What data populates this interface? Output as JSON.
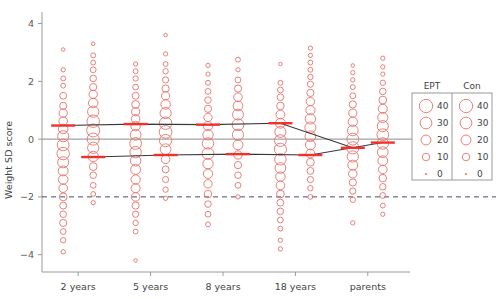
{
  "chart_data": {
    "type": "scatter",
    "title": "",
    "xlabel": "",
    "ylabel": "Weight SD score",
    "ylim": [
      -4.6,
      4.4
    ],
    "yticks": [
      4,
      2,
      0,
      -2,
      -4
    ],
    "ytick_labels": [
      "4",
      "2",
      "0",
      "−2",
      "−4"
    ],
    "categories": [
      "2 years",
      "5 years",
      "8 years",
      "18 years",
      "parents"
    ],
    "grid": false,
    "legend_position": "right",
    "reference_lines": [
      {
        "name": "zero-line",
        "y": 0,
        "style": "solid",
        "color": "#8c8c8c"
      },
      {
        "name": "minus-two-line",
        "y": -2,
        "style": "dashed",
        "color": "#4a4a6a"
      }
    ],
    "groups": [
      {
        "name": "EPT",
        "label": "EPT",
        "color": "#e8736a",
        "means": [
          0.47,
          0.52,
          0.5,
          0.55,
          -0.3
        ]
      },
      {
        "name": "Con",
        "label": "Con",
        "color": "#e8736a",
        "means": [
          -0.62,
          -0.55,
          -0.52,
          -0.55,
          -0.12
        ]
      }
    ],
    "series": [
      {
        "name": "EPT",
        "category": "2 years",
        "points": [
          {
            "y": 3.1,
            "n": 1
          },
          {
            "y": 2.4,
            "n": 2
          },
          {
            "y": 2.1,
            "n": 3
          },
          {
            "y": 1.85,
            "n": 3
          },
          {
            "y": 1.5,
            "n": 8
          },
          {
            "y": 1.15,
            "n": 9
          },
          {
            "y": 0.9,
            "n": 13
          },
          {
            "y": 0.62,
            "n": 14
          },
          {
            "y": 0.35,
            "n": 18
          },
          {
            "y": 0.1,
            "n": 26
          },
          {
            "y": -0.2,
            "n": 30
          },
          {
            "y": -0.5,
            "n": 34
          },
          {
            "y": -0.8,
            "n": 26
          },
          {
            "y": -1.1,
            "n": 20
          },
          {
            "y": -1.4,
            "n": 18
          },
          {
            "y": -1.7,
            "n": 14
          },
          {
            "y": -2.0,
            "n": 11
          },
          {
            "y": -2.3,
            "n": 8
          },
          {
            "y": -2.6,
            "n": 7
          },
          {
            "y": -2.9,
            "n": 9
          },
          {
            "y": -3.2,
            "n": 5
          },
          {
            "y": -3.5,
            "n": 4
          },
          {
            "y": -3.9,
            "n": 2
          }
        ]
      },
      {
        "name": "Con",
        "category": "2 years",
        "points": [
          {
            "y": 3.3,
            "n": 1
          },
          {
            "y": 2.9,
            "n": 3
          },
          {
            "y": 2.65,
            "n": 3
          },
          {
            "y": 2.4,
            "n": 5
          },
          {
            "y": 2.1,
            "n": 7
          },
          {
            "y": 1.8,
            "n": 9
          },
          {
            "y": 1.55,
            "n": 13
          },
          {
            "y": 1.25,
            "n": 18
          },
          {
            "y": 0.95,
            "n": 27
          },
          {
            "y": 0.62,
            "n": 34
          },
          {
            "y": 0.3,
            "n": 38
          },
          {
            "y": 0.0,
            "n": 32
          },
          {
            "y": -0.3,
            "n": 27
          },
          {
            "y": -0.6,
            "n": 22
          },
          {
            "y": -0.95,
            "n": 11
          },
          {
            "y": -1.25,
            "n": 7
          },
          {
            "y": -1.6,
            "n": 5
          },
          {
            "y": -1.9,
            "n": 3
          },
          {
            "y": -2.2,
            "n": 2
          }
        ]
      },
      {
        "name": "EPT",
        "category": "5 years",
        "points": [
          {
            "y": 2.6,
            "n": 2
          },
          {
            "y": 2.35,
            "n": 3
          },
          {
            "y": 2.1,
            "n": 4
          },
          {
            "y": 1.8,
            "n": 5
          },
          {
            "y": 1.5,
            "n": 8
          },
          {
            "y": 1.2,
            "n": 11
          },
          {
            "y": 0.95,
            "n": 12
          },
          {
            "y": 0.7,
            "n": 14
          },
          {
            "y": 0.45,
            "n": 18
          },
          {
            "y": 0.15,
            "n": 24
          },
          {
            "y": -0.15,
            "n": 30
          },
          {
            "y": -0.45,
            "n": 28
          },
          {
            "y": -0.75,
            "n": 23
          },
          {
            "y": -1.05,
            "n": 20
          },
          {
            "y": -1.4,
            "n": 17
          },
          {
            "y": -1.7,
            "n": 16
          },
          {
            "y": -2.0,
            "n": 14
          },
          {
            "y": -2.3,
            "n": 9
          },
          {
            "y": -2.6,
            "n": 6
          },
          {
            "y": -2.9,
            "n": 4
          },
          {
            "y": -3.2,
            "n": 3
          },
          {
            "y": -4.2,
            "n": 1
          }
        ]
      },
      {
        "name": "Con",
        "category": "5 years",
        "points": [
          {
            "y": 3.6,
            "n": 1
          },
          {
            "y": 2.95,
            "n": 2
          },
          {
            "y": 2.6,
            "n": 3
          },
          {
            "y": 2.35,
            "n": 4
          },
          {
            "y": 2.05,
            "n": 6
          },
          {
            "y": 1.75,
            "n": 9
          },
          {
            "y": 1.5,
            "n": 13
          },
          {
            "y": 1.2,
            "n": 18
          },
          {
            "y": 0.9,
            "n": 26
          },
          {
            "y": 0.55,
            "n": 34
          },
          {
            "y": 0.25,
            "n": 36
          },
          {
            "y": -0.05,
            "n": 33
          },
          {
            "y": -0.35,
            "n": 24
          },
          {
            "y": -0.7,
            "n": 14
          },
          {
            "y": -1.05,
            "n": 8
          },
          {
            "y": -1.4,
            "n": 6
          },
          {
            "y": -1.75,
            "n": 4
          },
          {
            "y": -2.05,
            "n": 2
          }
        ]
      },
      {
        "name": "EPT",
        "category": "8 years",
        "points": [
          {
            "y": 2.55,
            "n": 2
          },
          {
            "y": 2.25,
            "n": 2
          },
          {
            "y": 1.95,
            "n": 3
          },
          {
            "y": 1.65,
            "n": 5
          },
          {
            "y": 1.35,
            "n": 7
          },
          {
            "y": 1.05,
            "n": 9
          },
          {
            "y": 0.75,
            "n": 13
          },
          {
            "y": 0.45,
            "n": 17
          },
          {
            "y": 0.15,
            "n": 22
          },
          {
            "y": -0.15,
            "n": 28
          },
          {
            "y": -0.5,
            "n": 30
          },
          {
            "y": -0.85,
            "n": 22
          },
          {
            "y": -1.2,
            "n": 17
          },
          {
            "y": -1.55,
            "n": 13
          },
          {
            "y": -1.9,
            "n": 10
          },
          {
            "y": -2.25,
            "n": 7
          },
          {
            "y": -2.6,
            "n": 5
          },
          {
            "y": -2.95,
            "n": 3
          }
        ]
      },
      {
        "name": "Con",
        "category": "8 years",
        "points": [
          {
            "y": 2.75,
            "n": 3
          },
          {
            "y": 2.4,
            "n": 2
          },
          {
            "y": 2.05,
            "n": 5
          },
          {
            "y": 1.75,
            "n": 9
          },
          {
            "y": 1.45,
            "n": 14
          },
          {
            "y": 1.15,
            "n": 19
          },
          {
            "y": 0.85,
            "n": 25
          },
          {
            "y": 0.5,
            "n": 30
          },
          {
            "y": 0.15,
            "n": 27
          },
          {
            "y": -0.2,
            "n": 20
          },
          {
            "y": -0.55,
            "n": 13
          },
          {
            "y": -0.9,
            "n": 9
          },
          {
            "y": -1.25,
            "n": 7
          },
          {
            "y": -1.6,
            "n": 5
          },
          {
            "y": -2.0,
            "n": 2
          }
        ]
      },
      {
        "name": "EPT",
        "category": "18 years",
        "points": [
          {
            "y": 2.6,
            "n": 1
          },
          {
            "y": 1.95,
            "n": 3
          },
          {
            "y": 1.7,
            "n": 5
          },
          {
            "y": 1.45,
            "n": 7
          },
          {
            "y": 1.15,
            "n": 10
          },
          {
            "y": 0.85,
            "n": 15
          },
          {
            "y": 0.55,
            "n": 20
          },
          {
            "y": 0.25,
            "n": 26
          },
          {
            "y": -0.05,
            "n": 30
          },
          {
            "y": -0.35,
            "n": 32
          },
          {
            "y": -0.7,
            "n": 28
          },
          {
            "y": -1.0,
            "n": 24
          },
          {
            "y": -1.3,
            "n": 18
          },
          {
            "y": -1.6,
            "n": 14
          },
          {
            "y": -1.9,
            "n": 11
          },
          {
            "y": -2.2,
            "n": 8
          },
          {
            "y": -2.5,
            "n": 7
          },
          {
            "y": -2.8,
            "n": 5
          },
          {
            "y": -3.1,
            "n": 3
          },
          {
            "y": -3.5,
            "n": 2
          },
          {
            "y": -3.8,
            "n": 2
          }
        ]
      },
      {
        "name": "Con",
        "category": "18 years",
        "points": [
          {
            "y": 3.15,
            "n": 2
          },
          {
            "y": 2.9,
            "n": 2
          },
          {
            "y": 2.65,
            "n": 3
          },
          {
            "y": 2.4,
            "n": 3
          },
          {
            "y": 2.15,
            "n": 4
          },
          {
            "y": 1.9,
            "n": 6
          },
          {
            "y": 1.6,
            "n": 9
          },
          {
            "y": 1.3,
            "n": 13
          },
          {
            "y": 1.0,
            "n": 17
          },
          {
            "y": 0.7,
            "n": 22
          },
          {
            "y": 0.4,
            "n": 26
          },
          {
            "y": 0.1,
            "n": 24
          },
          {
            "y": -0.2,
            "n": 20
          },
          {
            "y": -0.5,
            "n": 15
          },
          {
            "y": -0.8,
            "n": 11
          },
          {
            "y": -1.1,
            "n": 8
          },
          {
            "y": -1.4,
            "n": 6
          },
          {
            "y": -1.7,
            "n": 4
          },
          {
            "y": -2.0,
            "n": 3
          }
        ]
      },
      {
        "name": "EPT",
        "category": "parents",
        "points": [
          {
            "y": 2.55,
            "n": 1
          },
          {
            "y": 2.3,
            "n": 2
          },
          {
            "y": 2.05,
            "n": 2
          },
          {
            "y": 1.8,
            "n": 3
          },
          {
            "y": 1.5,
            "n": 5
          },
          {
            "y": 1.2,
            "n": 9
          },
          {
            "y": 0.9,
            "n": 12
          },
          {
            "y": 0.6,
            "n": 17
          },
          {
            "y": 0.3,
            "n": 24
          },
          {
            "y": 0.0,
            "n": 30
          },
          {
            "y": -0.3,
            "n": 33
          },
          {
            "y": -0.6,
            "n": 27
          },
          {
            "y": -0.9,
            "n": 20
          },
          {
            "y": -1.2,
            "n": 14
          },
          {
            "y": -1.5,
            "n": 9
          },
          {
            "y": -1.8,
            "n": 6
          },
          {
            "y": -2.1,
            "n": 4
          },
          {
            "y": -2.9,
            "n": 2
          }
        ]
      },
      {
        "name": "Con",
        "category": "parents",
        "points": [
          {
            "y": 2.8,
            "n": 2
          },
          {
            "y": 2.5,
            "n": 2
          },
          {
            "y": 2.25,
            "n": 2
          },
          {
            "y": 1.95,
            "n": 4
          },
          {
            "y": 1.65,
            "n": 7
          },
          {
            "y": 1.35,
            "n": 11
          },
          {
            "y": 1.05,
            "n": 16
          },
          {
            "y": 0.75,
            "n": 21
          },
          {
            "y": 0.45,
            "n": 26
          },
          {
            "y": 0.15,
            "n": 30
          },
          {
            "y": -0.15,
            "n": 28
          },
          {
            "y": -0.45,
            "n": 24
          },
          {
            "y": -0.75,
            "n": 19
          },
          {
            "y": -1.05,
            "n": 14
          },
          {
            "y": -1.35,
            "n": 10
          },
          {
            "y": -1.65,
            "n": 7
          },
          {
            "y": -1.95,
            "n": 5
          },
          {
            "y": -2.3,
            "n": 3
          },
          {
            "y": -2.6,
            "n": 2
          }
        ]
      }
    ]
  },
  "legend": {
    "headers": [
      "EPT",
      "Con"
    ],
    "sizes": [
      40,
      30,
      20,
      10,
      0
    ],
    "size_labels": [
      "40",
      "30",
      "20",
      "10",
      "0"
    ]
  },
  "colors": {
    "marker": "#e8736a",
    "mean_marker": "#f0322a",
    "trend_line": "#3a3a3a",
    "zero_line": "#8c8c8c",
    "dashed_line": "#44445f",
    "axis": "#9a9a9a",
    "text": "#3f3f3f"
  }
}
